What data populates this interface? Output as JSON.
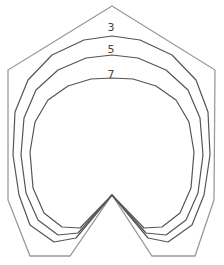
{
  "diagram": {
    "type": "contour-outline",
    "outline_color": "#9a9a9a",
    "contour_color": "#555555",
    "outer_boundary": "M112,6 L215,70 L214,200 L195,256 L152,256 L112,195 L70,256 L30,256 L8,200 L8,70 Z",
    "contours": [
      {
        "label": "3",
        "label_x": 111,
        "label_y": 31,
        "path": "M112,195 L148,238 L168,242 L192,225 L204,195 L210,155 L208,112 L196,80 L172,55 L140,40 L112,36 L84,40 L52,55 L28,80 L15,112 L13,155 L19,195 L30,225 L54,242 L76,238 Z"
      },
      {
        "label": "5",
        "label_x": 111,
        "label_y": 53,
        "path": "M112,195 L146,233 L166,235 L186,220 L198,193 L203,155 L200,118 L188,90 L166,70 L138,58 L112,55 L86,58 L58,70 L36,90 L24,118 L21,155 L26,193 L38,220 L58,235 L78,233 Z"
      },
      {
        "label": "7",
        "label_x": 111,
        "label_y": 78,
        "path": "M112,195 L144,228 L162,227 L180,213 L191,188 L194,152 L189,122 L176,100 L156,86 L133,79 L112,78 L91,79 L68,86 L48,100 L35,122 L30,152 L33,188 L44,213 L62,227 L80,228 Z"
      }
    ]
  }
}
